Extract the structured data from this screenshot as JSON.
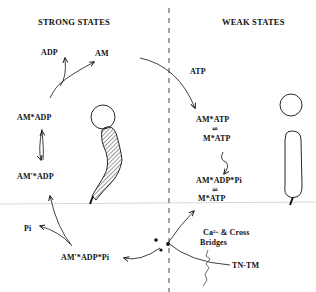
{
  "headers": {
    "strong": "STRONG STATES",
    "weak": "WEAK STATES"
  },
  "strong_states": {
    "adp": "ADP",
    "am": "AM",
    "am_adp": "AM*ADP",
    "am_prime_adp": "AM'*ADP",
    "pi": "Pi",
    "am_prime_adp_pi": "AM'*ADP*Pi"
  },
  "weak_states": {
    "atp": "ATP",
    "am_atp": "AM*ATP",
    "m_atp_1": "M*ATP",
    "am_adp_pi": "AM*ADP*Pi",
    "m_atp_2": "M*ATP"
  },
  "regulation": {
    "ca_line1_prefix": "Ca",
    "ca_superscript": "2+",
    "ca_line1_suffix": " & Cross",
    "ca_line2": "Bridges",
    "tn_tm": "TN-TM"
  },
  "equilibrium_symbol": "⇌",
  "colors": {
    "ink": "#111111",
    "divider": "#444444",
    "hatch": "#222222",
    "scan_line": "#d8d8d8"
  }
}
